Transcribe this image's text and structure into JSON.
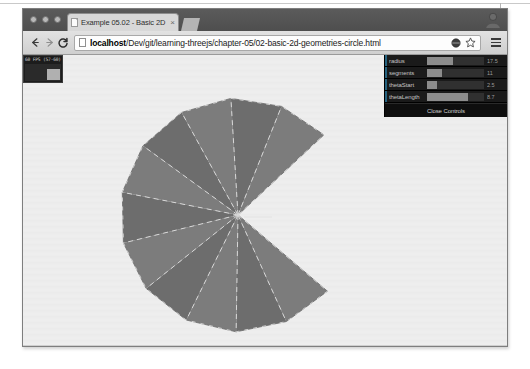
{
  "window": {
    "traffic_lights": [
      "close",
      "minimize",
      "zoom"
    ],
    "tab": {
      "title": "Example 05.02 - Basic 2D",
      "close_label": "×",
      "favicon": "page-icon"
    },
    "avatar": "profile-avatar-icon"
  },
  "toolbar": {
    "back_label": "←",
    "forward_label": "→",
    "reload_label": "C",
    "url_host": "localhost",
    "url_path": "/Dev/git/learning-threejs/chapter-05/02-basic-2d-geometries-circle.html",
    "url_full": "localhost/Dev/git/learning-threejs/chapter-05/02-basic-2d-geometries-circle.html",
    "extension_icon": "extension-circle-icon",
    "bookmark_icon": "star-icon",
    "menu_icon": "hamburger-menu-icon"
  },
  "stats": {
    "readout": "60 FPS (57-60)",
    "bar_height_pct": 72
  },
  "gui": {
    "rows": [
      {
        "name": "radius",
        "value": "17.5",
        "fill_pct": 46
      },
      {
        "name": "segments",
        "value": "11",
        "fill_pct": 26
      },
      {
        "name": "thetaStart",
        "value": "2.5",
        "fill_pct": 18
      },
      {
        "name": "thetaLength",
        "value": "8.7",
        "fill_pct": 72
      }
    ],
    "close_label": "Close Controls",
    "accent_color": "#2fa1d6",
    "panel_color": "#1a1a1a"
  },
  "scene": {
    "background_color": "#ededed",
    "mesh_fill_color": "#7c7c7c",
    "mesh_fill_color_dark": "#6d6d6d",
    "wireframe_color": "#d8d8d8",
    "center_x": 215,
    "center_y": 160,
    "radius_px": 118,
    "theta_start_deg": 43,
    "theta_length_deg": 276,
    "segments": 11,
    "geometry": "CircleGeometry"
  }
}
